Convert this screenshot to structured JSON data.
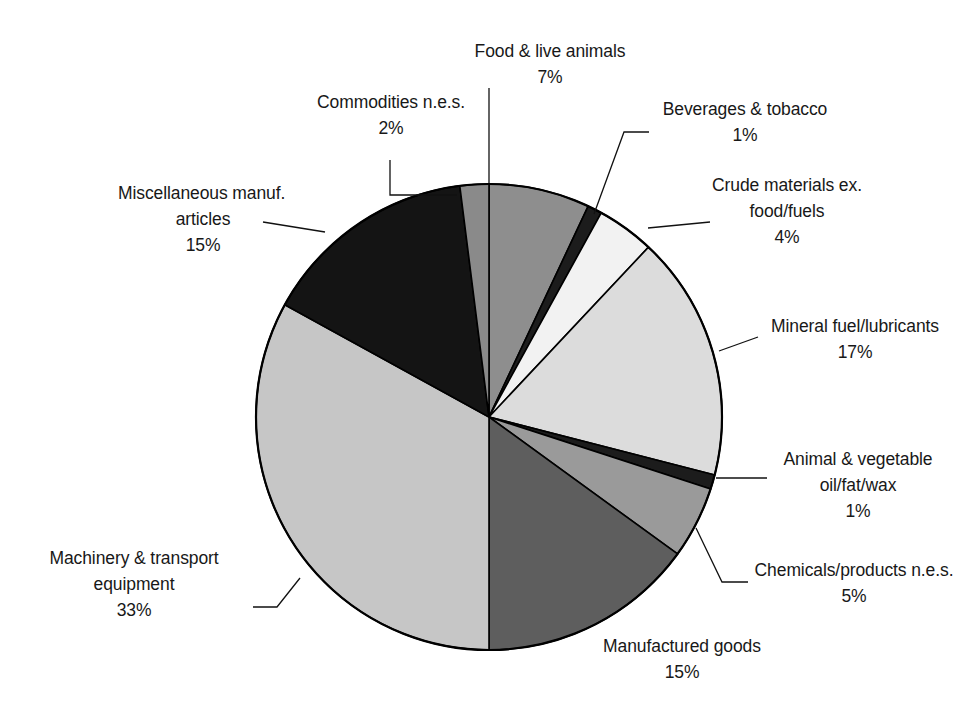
{
  "chart_data": {
    "type": "pie",
    "title": "",
    "subtitle": "",
    "xlabel": "",
    "ylabel": "",
    "legend_position": "none",
    "grid": false,
    "units": "percent",
    "start_angle_deg": 0,
    "direction": "clockwise",
    "categories": [
      "Food & live animals",
      "Beverages & tobacco",
      "Crude materials ex. food/fuels",
      "Mineral fuel/lubricants",
      "Animal & vegetable oil/fat/wax",
      "Chemicals/products n.e.s.",
      "Manufactured goods",
      "Machinery & transport equipment",
      "Miscellaneous manuf. articles",
      "Commodities n.e.s."
    ],
    "values": [
      7,
      1,
      4,
      17,
      1,
      5,
      15,
      33,
      15,
      2
    ],
    "value_labels": [
      "7%",
      "1%",
      "4%",
      "17%",
      "1%",
      "5%",
      "15%",
      "33%",
      "15%",
      "2%"
    ],
    "slice_colors": [
      "#8e8e8e",
      "#1c1c1c",
      "#f2f2f2",
      "#dcdcdc",
      "#1c1c1c",
      "#9a9a9a",
      "#5e5e5e",
      "#c6c6c6",
      "#141414",
      "#8a8a8a"
    ]
  },
  "pie": {
    "center_x": 489,
    "center_y": 417,
    "radius": 233,
    "outline_color": "#000000",
    "leader_color": "#111111"
  },
  "labels": [
    {
      "key": "food",
      "name": "Food & live animals",
      "line1": "Food & live animals",
      "line2": "",
      "pct": "7%"
    },
    {
      "key": "beverages",
      "name": "Beverages & tobacco",
      "line1": "Beverages & tobacco",
      "line2": "",
      "pct": "1%"
    },
    {
      "key": "crude",
      "name": "Crude materials ex. food/fuels",
      "line1": "Crude materials ex.",
      "line2": "food/fuels",
      "pct": "4%"
    },
    {
      "key": "mineral",
      "name": "Mineral fuel/lubricants",
      "line1": "Mineral fuel/lubricants",
      "line2": "",
      "pct": "17%"
    },
    {
      "key": "animal",
      "name": "Animal & vegetable oil/fat/wax",
      "line1": "Animal & vegetable",
      "line2": "oil/fat/wax",
      "pct": "1%"
    },
    {
      "key": "chemicals",
      "name": "Chemicals/products n.e.s.",
      "line1": "Chemicals/products n.e.s.",
      "line2": "",
      "pct": "5%"
    },
    {
      "key": "manufactured",
      "name": "Manufactured goods",
      "line1": "Manufactured goods",
      "line2": "",
      "pct": "15%"
    },
    {
      "key": "machinery",
      "name": "Machinery & transport equipment",
      "line1": "Machinery & transport",
      "line2": "equipment",
      "pct": "33%"
    },
    {
      "key": "misc",
      "name": "Miscellaneous manuf. articles",
      "line1": "Miscellaneous manuf.",
      "line2": "articles",
      "pct": "15%"
    },
    {
      "key": "commodities",
      "name": "Commodities n.e.s.",
      "line1": "Commodities n.e.s.",
      "line2": "",
      "pct": "2%"
    }
  ]
}
